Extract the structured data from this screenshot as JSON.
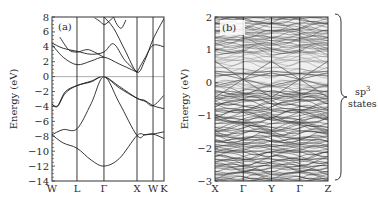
{
  "chart_data": [
    {
      "panel": "(a)",
      "type": "line",
      "title": "",
      "xlabel": "",
      "ylabel": "Energy (eV)",
      "ylim": [
        -14,
        8
      ],
      "yticks": [
        8,
        6,
        4,
        2,
        0,
        -2,
        -4,
        -6,
        -8,
        -10,
        -12,
        -14
      ],
      "ytick_labels": [
        "8",
        "6",
        "4",
        "2",
        "0",
        "−2",
        "−4",
        "−6",
        "−8",
        "−10",
        "−12",
        "−14"
      ],
      "kpoints": [
        "W",
        "L",
        "Γ",
        "X",
        "W",
        "K"
      ],
      "kpoint_positions": [
        0,
        0.223,
        0.464,
        0.759,
        0.902,
        1.0
      ],
      "fermi_level": 0,
      "grid": false,
      "series": [
        {
          "name": "band-1",
          "x": [
            0,
            0.1,
            0.223,
            0.35,
            0.464,
            0.6,
            0.759,
            0.83,
            0.902,
            1.0
          ],
          "y": [
            -7.8,
            -8.9,
            -9.6,
            -11.2,
            -12.0,
            -11.0,
            -7.9,
            -7.8,
            -7.7,
            -8.3
          ]
        },
        {
          "name": "band-2",
          "x": [
            0,
            0.1,
            0.223,
            0.35,
            0.464,
            0.6,
            0.759,
            0.83,
            0.902,
            1.0
          ],
          "y": [
            -7.8,
            -7.1,
            -7.0,
            -3.6,
            0.0,
            -3.5,
            -7.9,
            -7.8,
            -7.7,
            -7.4
          ]
        },
        {
          "name": "band-3",
          "x": [
            0,
            0.05,
            0.12,
            0.223,
            0.35,
            0.464,
            0.6,
            0.759,
            0.83,
            0.902,
            1.0
          ],
          "y": [
            -3.7,
            -4.0,
            -2.2,
            -1.2,
            -0.7,
            0.0,
            -1.5,
            -2.9,
            -3.2,
            -3.9,
            -4.3
          ]
        },
        {
          "name": "band-4",
          "x": [
            0,
            0.05,
            0.12,
            0.223,
            0.35,
            0.464,
            0.6,
            0.759,
            0.83,
            0.902,
            1.0
          ],
          "y": [
            -3.7,
            -3.9,
            -2.0,
            -1.2,
            -0.6,
            0.0,
            -1.3,
            -2.9,
            -3.3,
            -3.9,
            -2.5
          ]
        },
        {
          "name": "band-5",
          "x": [
            0,
            0.1,
            0.223,
            0.35,
            0.464,
            0.6,
            0.759
          ],
          "y": [
            4.3,
            2.6,
            1.6,
            2.1,
            2.6,
            1.7,
            0.6
          ]
        },
        {
          "name": "band-6",
          "x": [
            0,
            0.1,
            0.223,
            0.35,
            0.464,
            0.55,
            0.65,
            0.759
          ],
          "y": [
            4.5,
            3.8,
            3.4,
            3.0,
            3.3,
            4.4,
            2.2,
            0.6
          ]
        },
        {
          "name": "band-7",
          "x": [
            0.759,
            0.83,
            0.902,
            1.0
          ],
          "y": [
            0.6,
            2.5,
            4.2,
            4.0
          ]
        },
        {
          "name": "band-8",
          "x": [
            0.07,
            0.15,
            0.223,
            0.3,
            0.35,
            0.464
          ],
          "y": [
            5.3,
            3.6,
            3.3,
            3.6,
            3.5,
            2.6
          ]
        },
        {
          "name": "band-9",
          "x": [
            0.464,
            0.55,
            0.65,
            0.759,
            0.83,
            0.902,
            1.0
          ],
          "y": [
            8.0,
            6.5,
            3.6,
            0.6,
            2.2,
            5.0,
            7.8
          ]
        },
        {
          "name": "band-10",
          "x": [
            0.38,
            0.42,
            0.464,
            0.5,
            0.55
          ],
          "y": [
            7.9,
            7.5,
            7.0,
            7.3,
            8.0
          ]
        },
        {
          "name": "band-11",
          "x": [
            0.55,
            0.58,
            0.62,
            0.66
          ],
          "y": [
            8.0,
            7.0,
            6.5,
            7.6
          ]
        }
      ]
    },
    {
      "panel": "(b)",
      "type": "line",
      "title": "",
      "xlabel": "",
      "ylabel": "Energy (eV)",
      "ylim": [
        -3,
        2
      ],
      "yticks": [
        2,
        1,
        0,
        -1,
        -2,
        -3
      ],
      "ytick_labels": [
        "2",
        "1",
        "0",
        "−1",
        "−2",
        "−3"
      ],
      "kpoints": [
        "X",
        "Γ",
        "Y",
        "Γ",
        "Z"
      ],
      "kpoint_positions": [
        0,
        0.25,
        0.5,
        0.75,
        1.0
      ],
      "grid": false,
      "description": "Dense manifold of many nearly-flat bands spanning the full energy window; lighter region between about 0 and 0.8 eV with crossing bands forming X-shapes around Y",
      "annotation": {
        "text": "sp",
        "superscript": "3",
        "line2": "states",
        "brace_range": [
          -3,
          2
        ]
      }
    }
  ],
  "figure": {
    "panel_a_label": "(a)",
    "panel_b_label": "(b)",
    "ylabel_a": "Energy (eV)",
    "ylabel_b": "Energy (eV)",
    "brace_text_main": "sp",
    "brace_text_sup": "3",
    "brace_text_line2": "states"
  }
}
